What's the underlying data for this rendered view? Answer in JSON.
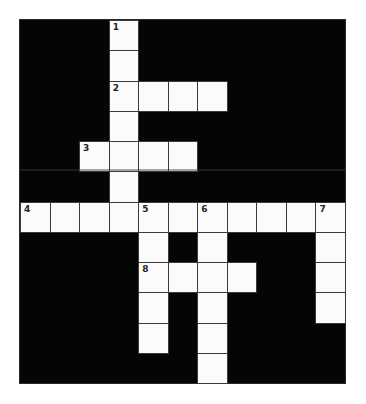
{
  "puzzle": {
    "rows": 12,
    "cols": 11,
    "colors": {
      "block": "#050505",
      "cell": "#fbfbfb",
      "border": "#3a3a3a",
      "number": "#222222"
    },
    "cells": [
      {
        "r": 0,
        "c": 3,
        "num": "1"
      },
      {
        "r": 1,
        "c": 3
      },
      {
        "r": 2,
        "c": 3,
        "num": "2"
      },
      {
        "r": 2,
        "c": 4
      },
      {
        "r": 2,
        "c": 5
      },
      {
        "r": 2,
        "c": 6
      },
      {
        "r": 3,
        "c": 3
      },
      {
        "r": 4,
        "c": 2,
        "num": "3"
      },
      {
        "r": 4,
        "c": 3
      },
      {
        "r": 4,
        "c": 4
      },
      {
        "r": 4,
        "c": 5
      },
      {
        "r": 5,
        "c": 3
      },
      {
        "r": 6,
        "c": 0,
        "num": "4"
      },
      {
        "r": 6,
        "c": 1
      },
      {
        "r": 6,
        "c": 2
      },
      {
        "r": 6,
        "c": 3
      },
      {
        "r": 6,
        "c": 4,
        "num": "5"
      },
      {
        "r": 6,
        "c": 5
      },
      {
        "r": 6,
        "c": 6,
        "num": "6"
      },
      {
        "r": 6,
        "c": 7
      },
      {
        "r": 6,
        "c": 8
      },
      {
        "r": 6,
        "c": 9
      },
      {
        "r": 6,
        "c": 10,
        "num": "7"
      },
      {
        "r": 7,
        "c": 4
      },
      {
        "r": 7,
        "c": 6
      },
      {
        "r": 7,
        "c": 10
      },
      {
        "r": 8,
        "c": 4,
        "num": "8"
      },
      {
        "r": 8,
        "c": 5
      },
      {
        "r": 8,
        "c": 6
      },
      {
        "r": 8,
        "c": 7
      },
      {
        "r": 8,
        "c": 10
      },
      {
        "r": 9,
        "c": 4
      },
      {
        "r": 9,
        "c": 6
      },
      {
        "r": 9,
        "c": 10
      },
      {
        "r": 10,
        "c": 4
      },
      {
        "r": 10,
        "c": 6
      },
      {
        "r": 11,
        "c": 6
      }
    ],
    "clue_numbers": [
      "1",
      "2",
      "3",
      "4",
      "5",
      "6",
      "7",
      "8"
    ]
  }
}
